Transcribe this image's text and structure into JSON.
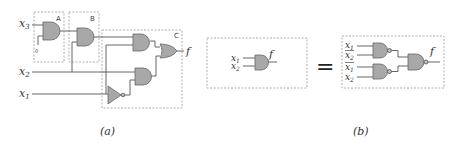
{
  "figure": {
    "panel_a": {
      "caption": "(a)",
      "inputs": [
        "x3",
        "x2",
        "x1"
      ],
      "input_labels": {
        "x3": "x",
        "x3_sub": "3",
        "x2": "x",
        "x2_sub": "2",
        "x1": "x",
        "x1_sub": "1"
      },
      "constant_input": "0",
      "boxes": [
        {
          "id": "A",
          "label": "A"
        },
        {
          "id": "B",
          "label": "B"
        },
        {
          "id": "C",
          "label": "C"
        }
      ],
      "output": "f",
      "gates": [
        "AND (box A)",
        "AND (box B)",
        "AND (box C, top)",
        "AND (box C, bottom)",
        "OR (box C)",
        "NOT (box C)"
      ]
    },
    "equals_sign": "=",
    "panel_b": {
      "caption": "(b)",
      "left": {
        "inputs": [
          {
            "name": "x",
            "sub": "1"
          },
          {
            "name": "x",
            "sub": "2"
          }
        ],
        "gate": "AND",
        "output": "f"
      },
      "right": {
        "inputs": [
          {
            "name": "x",
            "sub": "1",
            "bar": false
          },
          {
            "name": "x",
            "sub": "2",
            "bar": true
          },
          {
            "name": "x",
            "sub": "1",
            "bar": true
          },
          {
            "name": "x",
            "sub": "2",
            "bar": false
          }
        ],
        "gates": [
          "NAND",
          "NAND",
          "NAND"
        ],
        "output": "f"
      }
    }
  }
}
